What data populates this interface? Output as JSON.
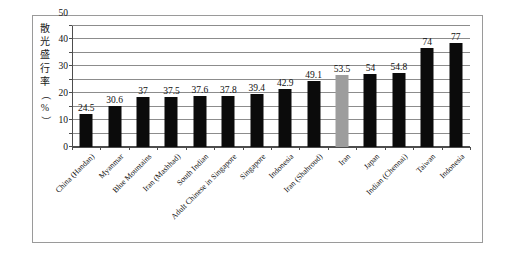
{
  "chart_data": {
    "type": "bar",
    "title": "",
    "subtitle": "",
    "xlabel": "",
    "ylabel": "散光盛行率（%）",
    "ylabel_chars": [
      "散",
      "光",
      "盛",
      "行",
      "率",
      "（",
      "%",
      "）"
    ],
    "ylim": [
      0,
      90
    ],
    "y_ticks": [
      0,
      10,
      20,
      30,
      40,
      50,
      60,
      70,
      80,
      90
    ],
    "grid": true,
    "legend": "none",
    "categories": [
      "China (Handan)",
      "Myanmar",
      "Blue Mountains",
      "Iran (Mashhad)",
      "South Indian",
      "Adult Chinese in Singapore",
      "Singapore",
      "Indonesia",
      "Iran (Shahroud)",
      "Iran",
      "Japan",
      "Indian (Chennai)",
      "Taiwan",
      "Indonesia"
    ],
    "values": [
      24.5,
      30.6,
      37,
      37.5,
      37.6,
      37.8,
      39.4,
      42.9,
      49.1,
      53.5,
      54,
      54.8,
      74,
      77
    ],
    "value_labels": [
      "24.5",
      "30.6",
      "37",
      "37.5",
      "37.6",
      "37.8",
      "39.4",
      "42.9",
      "49.1",
      "53.5",
      "54",
      "54.8",
      "74",
      "77"
    ],
    "highlighted_index": 9,
    "colors": {
      "bar": "#0b0b0b",
      "bar_highlight": "#9d9d9d",
      "grid": "#8c8c8c",
      "axis": "#4d4d4d",
      "frame": "#9a9a9a",
      "text": "#111111",
      "background": "#ffffff"
    }
  }
}
